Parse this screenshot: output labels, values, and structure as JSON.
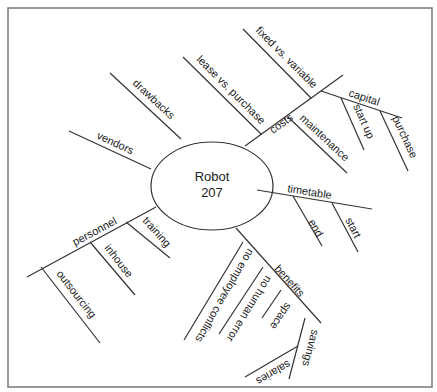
{
  "diagram": {
    "type": "mind-map",
    "colors": {
      "line": "#333333",
      "frame": "#777777",
      "text": "#222222",
      "background": "#ffffff"
    },
    "center": {
      "line1": "Robot",
      "line2": "207"
    },
    "branches": {
      "vendors": "vendors",
      "drawbacks": "drawbacks",
      "costs": {
        "label": "costs",
        "lease_vs_purchase": "lease vs. purchase",
        "fixed_vs_variable": "fixed vs. variable",
        "maintenance": "maintenance",
        "capital": {
          "label": "capital",
          "start_up": "start up",
          "purchase": "purchase"
        }
      },
      "timetable": {
        "label": "timetable",
        "end": "end",
        "start": "start"
      },
      "benefits": {
        "label": "benefits",
        "no_employee_conflicts": "no employee conflicts",
        "no_human_error": "no human error",
        "space": "space",
        "savings": {
          "label": "savings",
          "salaries": "salaries"
        }
      },
      "personnel": {
        "label": "personnel",
        "training": "training",
        "inhouse": "inhouse",
        "outsourcing": "outsourcing"
      }
    }
  }
}
